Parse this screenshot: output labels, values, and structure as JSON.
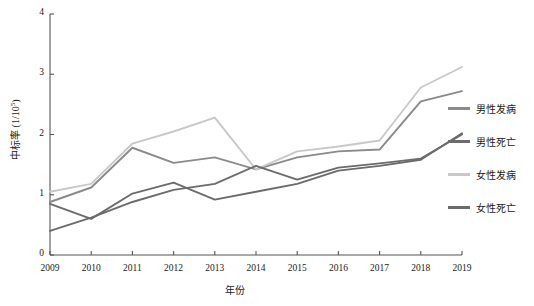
{
  "chart_data": {
    "type": "line",
    "title": "",
    "xlabel": "年份",
    "ylabel": "中标率 (1/10⁵)",
    "ylabel_base": "中标率 (1/10",
    "ylabel_exp": "5",
    "ylabel_tail": ")",
    "categories": [
      "2009",
      "2010",
      "2011",
      "2012",
      "2013",
      "2014",
      "2015",
      "2016",
      "2017",
      "2018",
      "2019"
    ],
    "x": [
      2009,
      2010,
      2011,
      2012,
      2013,
      2014,
      2015,
      2016,
      2017,
      2018,
      2019
    ],
    "xlim": [
      2009,
      2019
    ],
    "ylim": [
      0,
      4
    ],
    "yticks": [
      0,
      1,
      2,
      3,
      4
    ],
    "ytick_labels": [
      "0",
      "1",
      "2",
      "3",
      "4"
    ],
    "grid": false,
    "legend_position": "right",
    "series": [
      {
        "name": "男性发病",
        "color": "#8a8a8a",
        "values": [
          0.88,
          1.12,
          1.78,
          1.53,
          1.62,
          1.42,
          1.62,
          1.72,
          1.75,
          2.55,
          2.72
        ]
      },
      {
        "name": "男性死亡",
        "color": "#6b6b6b",
        "values": [
          0.85,
          0.6,
          1.02,
          1.2,
          0.92,
          1.05,
          1.18,
          1.4,
          1.48,
          1.58,
          2.02
        ]
      },
      {
        "name": "女性发病",
        "color": "#c8c8c8",
        "values": [
          1.05,
          1.18,
          1.85,
          2.05,
          2.28,
          1.42,
          1.72,
          1.8,
          1.9,
          2.78,
          3.12
        ]
      },
      {
        "name": "女性死亡",
        "color": "#6b6b6b",
        "values": [
          0.4,
          0.62,
          0.88,
          1.08,
          1.18,
          1.48,
          1.25,
          1.45,
          1.52,
          1.6,
          2.0
        ]
      }
    ]
  },
  "legend": {
    "items": [
      {
        "label": "男性发病",
        "color": "#8a8a8a"
      },
      {
        "label": "男性死亡",
        "color": "#6b6b6b"
      },
      {
        "label": "女性发病",
        "color": "#c8c8c8"
      },
      {
        "label": "女性死亡",
        "color": "#6b6b6b"
      }
    ]
  },
  "axes": {
    "x_title": "年份",
    "y_title_base": "中标率 (1/10",
    "y_title_exp": "5",
    "y_title_tail": ")"
  }
}
